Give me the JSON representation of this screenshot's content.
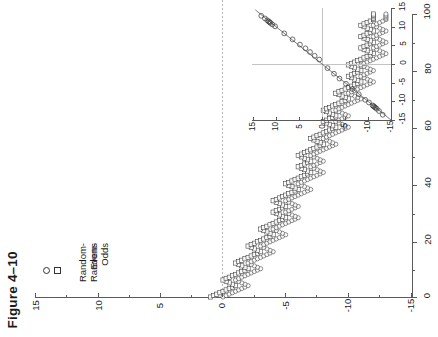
{
  "figure": {
    "caption": "Figure 4–10"
  },
  "legend": {
    "items": [
      {
        "label": "Random-Evens",
        "marker": "circle-marker"
      },
      {
        "label": "Random-Odds",
        "marker": "square-marker"
      }
    ]
  },
  "colors": {
    "axis": "#5a5a5a",
    "grid": "#b5b5b5",
    "marker_stroke": "#333333",
    "line": "#555555",
    "background": "#ffffff"
  },
  "chart_data": {
    "type": "line",
    "title": "Figure 4–10",
    "orientation": "rotated-90-ccw",
    "xlabel": "",
    "ylabel": "",
    "grid": true,
    "legend_position": "left",
    "xlim": [
      0,
      100
    ],
    "ylim": [
      -15,
      15
    ],
    "xticks": [
      0,
      20,
      40,
      60,
      80,
      100
    ],
    "xtick_labels": [
      "0",
      "20",
      "40",
      "60",
      "80",
      "100"
    ],
    "yticks": [
      15,
      10,
      5,
      0,
      -5,
      -10,
      -15
    ],
    "ytick_labels": [
      "15",
      "10",
      "5",
      "0",
      "-5",
      "-10",
      "-15"
    ],
    "zero_reference_line": 0,
    "series": [
      {
        "name": "Random-Evens",
        "marker": "circle",
        "x": [
          0,
          2,
          4,
          6,
          8,
          10,
          12,
          14,
          16,
          18,
          20,
          22,
          24,
          26,
          28,
          30,
          32,
          34,
          36,
          38,
          40,
          42,
          44,
          46,
          48,
          50,
          52,
          54,
          56,
          58,
          60,
          62,
          64,
          66,
          68,
          70,
          72,
          74,
          76,
          78,
          80,
          82,
          84,
          86,
          88,
          90,
          92,
          94,
          96,
          98,
          100
        ],
        "y": [
          0,
          -1,
          -2,
          -1,
          -2,
          -3,
          -2,
          -3,
          -4,
          -3,
          -4,
          -5,
          -4,
          -5,
          -6,
          -5,
          -6,
          -5,
          -6,
          -7,
          -6,
          -7,
          -8,
          -7,
          -8,
          -7,
          -8,
          -9,
          -8,
          -9,
          -10,
          -9,
          -10,
          -9,
          -10,
          -11,
          -10,
          -11,
          -12,
          -11,
          -12,
          -11,
          -12,
          -13,
          -12,
          -13,
          -12,
          -13,
          -12,
          -13,
          -13
        ]
      },
      {
        "name": "Random-Odds",
        "marker": "square",
        "x": [
          0,
          2,
          4,
          6,
          8,
          10,
          12,
          14,
          16,
          18,
          20,
          22,
          24,
          26,
          28,
          30,
          32,
          34,
          36,
          38,
          40,
          42,
          44,
          46,
          48,
          50,
          52,
          54,
          56,
          58,
          60,
          62,
          64,
          66,
          68,
          70,
          72,
          74,
          76,
          78,
          80,
          82,
          84,
          86,
          88,
          90,
          92,
          94,
          96,
          98,
          100
        ],
        "y": [
          1,
          0,
          -1,
          0,
          -1,
          -2,
          -1,
          -2,
          -3,
          -2,
          -3,
          -4,
          -3,
          -4,
          -5,
          -4,
          -5,
          -4,
          -5,
          -6,
          -5,
          -6,
          -7,
          -6,
          -7,
          -6,
          -7,
          -8,
          -7,
          -8,
          -9,
          -8,
          -9,
          -8,
          -9,
          -10,
          -9,
          -10,
          -11,
          -10,
          -11,
          -10,
          -11,
          -12,
          -11,
          -12,
          -11,
          -12,
          -11,
          -12,
          -12
        ]
      }
    ]
  },
  "inset_chart_data": {
    "type": "scatter",
    "title": "",
    "orientation": "rotated-90-ccw",
    "grid": true,
    "xlim": [
      -15,
      15
    ],
    "ylim": [
      -15,
      15
    ],
    "xticks": [
      15,
      10,
      5,
      0,
      -5,
      -10,
      -15
    ],
    "xtick_labels": [
      "15",
      "10",
      "5",
      "0",
      "-5",
      "-10",
      "-15"
    ],
    "yticks": [
      15,
      10,
      5,
      0,
      -5,
      -10,
      -15
    ],
    "ytick_labels": [
      "15",
      "10",
      "5",
      "0",
      "-5",
      "-10",
      "-15"
    ],
    "reference_line": {
      "slope": 1,
      "intercept": 0,
      "label": "identity-line"
    },
    "marker": "circle",
    "points_x": [
      -13.2,
      -12.4,
      -11.9,
      -11.6,
      -11.4,
      -11.2,
      -11.0,
      -10.2,
      -9.4,
      -8.0,
      -6.6,
      -5.2,
      -3.8,
      -2.6,
      -1.2,
      0.6,
      1.6,
      2.6,
      3.6,
      4.8,
      6.4,
      8.2,
      10.2,
      10.8,
      11.2,
      11.4,
      11.6,
      11.9,
      12.4,
      13.2
    ],
    "points_y": [
      -13.6,
      -12.6,
      -12.0,
      -11.7,
      -11.5,
      -11.3,
      -11.1,
      -10.3,
      -9.6,
      -8.1,
      -6.7,
      -5.3,
      -3.9,
      -2.6,
      -1.1,
      1.2,
      2.2,
      3.2,
      4.2,
      5.2,
      6.6,
      8.2,
      10.1,
      10.6,
      11.0,
      11.2,
      11.4,
      11.7,
      12.2,
      12.9
    ]
  }
}
